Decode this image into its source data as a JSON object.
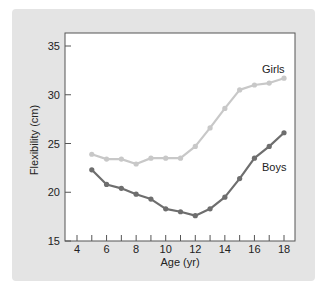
{
  "chart_data": {
    "type": "line",
    "title": "",
    "xlabel": "Age (yr)",
    "ylabel": "Flexibility (cm)",
    "xlim": [
      4,
      18
    ],
    "ylim": [
      15,
      35
    ],
    "x_ticks": [
      4,
      6,
      8,
      10,
      12,
      14,
      16,
      18
    ],
    "y_ticks": [
      15,
      20,
      25,
      30,
      35
    ],
    "grid": false,
    "legend_position": "inline labels near line ends",
    "x": [
      5,
      6,
      7,
      8,
      9,
      10,
      11,
      12,
      13,
      14,
      15,
      16,
      17,
      18
    ],
    "series": [
      {
        "name": "Girls",
        "color": "#c8c8c8",
        "values": [
          23.9,
          23.4,
          23.4,
          22.9,
          23.5,
          23.5,
          23.5,
          24.7,
          26.6,
          28.6,
          30.5,
          31.0,
          31.2,
          31.7
        ]
      },
      {
        "name": "Boys",
        "color": "#6e6e6e",
        "values": [
          22.3,
          20.8,
          20.4,
          19.8,
          19.3,
          18.3,
          18.0,
          17.6,
          18.3,
          19.5,
          21.4,
          23.5,
          24.7,
          26.1
        ]
      }
    ]
  },
  "colors": {
    "panel_background": "#e4e4e4",
    "plot_background": "#ffffff",
    "axis": "#333333"
  }
}
